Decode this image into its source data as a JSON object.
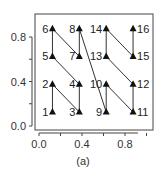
{
  "chart_data": {
    "type": "line",
    "title": "",
    "caption": "(a)",
    "xlabel": "",
    "ylabel": "",
    "xlim": [
      -0.05,
      1.0
    ],
    "ylim": [
      -0.02,
      1.0
    ],
    "grid": false,
    "x_ticks": [
      0.0,
      0.2,
      0.4,
      0.6,
      0.8
    ],
    "x_tick_labels": [
      "0.0",
      "",
      "0.4",
      "",
      "0.8"
    ],
    "y_ticks": [
      0.0,
      0.2,
      0.4,
      0.6,
      0.8
    ],
    "y_tick_labels": [
      "0.0",
      "",
      "0.4",
      "",
      "0.8"
    ],
    "marker": "triangle",
    "points": [
      {
        "label": "1",
        "x": 0.125,
        "y": 0.125
      },
      {
        "label": "2",
        "x": 0.125,
        "y": 0.375
      },
      {
        "label": "3",
        "x": 0.375,
        "y": 0.125
      },
      {
        "label": "4",
        "x": 0.375,
        "y": 0.375
      },
      {
        "label": "5",
        "x": 0.125,
        "y": 0.625
      },
      {
        "label": "6",
        "x": 0.125,
        "y": 0.875
      },
      {
        "label": "7",
        "x": 0.375,
        "y": 0.625
      },
      {
        "label": "8",
        "x": 0.375,
        "y": 0.875
      },
      {
        "label": "9",
        "x": 0.625,
        "y": 0.125
      },
      {
        "label": "10",
        "x": 0.625,
        "y": 0.375
      },
      {
        "label": "11",
        "x": 0.875,
        "y": 0.125
      },
      {
        "label": "12",
        "x": 0.875,
        "y": 0.375
      },
      {
        "label": "13",
        "x": 0.625,
        "y": 0.625
      },
      {
        "label": "14",
        "x": 0.625,
        "y": 0.875
      },
      {
        "label": "15",
        "x": 0.875,
        "y": 0.625
      },
      {
        "label": "16",
        "x": 0.875,
        "y": 0.875
      }
    ]
  },
  "colors": {
    "line": "#333333",
    "marker": "#111111",
    "axis": "#444444"
  }
}
